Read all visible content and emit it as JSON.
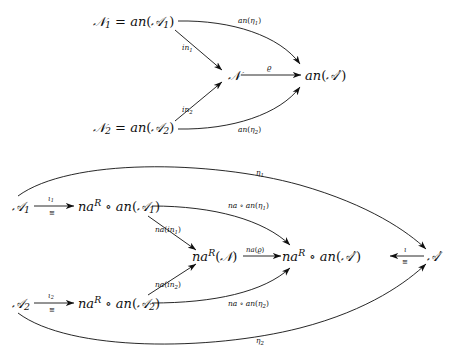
{
  "figure": {
    "type": "commutative-diagram",
    "count": 2
  },
  "diagram_top": {
    "nodes": {
      "n1": {
        "id": "N1",
        "text": "ℕ₁ = an(𝒜₁)",
        "base": "𝒩",
        "sub": "1",
        "rhs": "an(𝒜",
        "rhs_sub": "1",
        "x": 140,
        "y": 22
      },
      "n2": {
        "id": "N2",
        "text": "𝒩₂ = an(𝒜₂)",
        "x": 140,
        "y": 128
      },
      "n": {
        "id": "N",
        "text": "𝒩",
        "x": 238,
        "y": 75
      },
      "target": {
        "id": "anA",
        "text": "an(𝒜′)",
        "x": 333,
        "y": 75
      }
    },
    "edges": [
      {
        "name": "in1",
        "label": "in",
        "label_sub": "1",
        "from": "N1",
        "to": "N"
      },
      {
        "name": "in2",
        "label": "in",
        "label_sub": "2",
        "from": "N2",
        "to": "N"
      },
      {
        "name": "an-eta1",
        "label": "an(η",
        "label_sub": "1",
        "label_tail": ")",
        "from": "N1",
        "to": "anA"
      },
      {
        "name": "an-eta2",
        "label": "an(η",
        "label_sub": "2",
        "label_tail": ")",
        "from": "N2",
        "to": "anA"
      },
      {
        "name": "rho",
        "label": "ϱ",
        "from": "N",
        "to": "anA"
      }
    ]
  },
  "diagram_bottom": {
    "nodes": {
      "a1": {
        "id": "A1",
        "text": "𝒜₁",
        "x": 22,
        "y": 206
      },
      "a2": {
        "id": "A2",
        "text": "𝒜₂",
        "x": 22,
        "y": 303
      },
      "naA1": {
        "id": "naRanA1",
        "text": "naᴿ ∘ an(𝒜₁)",
        "x": 112,
        "y": 206
      },
      "naA2": {
        "id": "naRanA2",
        "text": "naᴿ ∘ an(𝒜₂)",
        "x": 112,
        "y": 303
      },
      "naN": {
        "id": "naRN",
        "text": "naᴿ(𝒩)",
        "x": 223,
        "y": 257
      },
      "naAp": {
        "id": "naRanAp",
        "text": "naᴿ ∘ an(𝒜′)",
        "x": 330,
        "y": 257
      },
      "ap": {
        "id": "Ap",
        "text": "𝒜′",
        "x": 435,
        "y": 257
      }
    },
    "edges": [
      {
        "name": "iota1",
        "label": "ι",
        "label_sub": "1",
        "label_below": "≅",
        "from": "A1",
        "to": "naRanA1"
      },
      {
        "name": "iota2",
        "label": "ι",
        "label_sub": "2",
        "label_below": "≅",
        "from": "A2",
        "to": "naRanA2"
      },
      {
        "name": "na-in1",
        "label": "na(in",
        "label_sub": "1",
        "label_tail": ")",
        "from": "naRanA1",
        "to": "naRN"
      },
      {
        "name": "na-in2",
        "label": "na(in",
        "label_sub": "2",
        "label_tail": ")",
        "from": "naRanA2",
        "to": "naRN"
      },
      {
        "name": "na-rho",
        "label": "na(ϱ)",
        "from": "naRN",
        "to": "naRanAp"
      },
      {
        "name": "na-an-eta1",
        "label": "na ∘ an(η",
        "label_sub": "1",
        "label_tail": ")",
        "from": "naRanA1",
        "to": "naRanAp"
      },
      {
        "name": "na-an-eta2",
        "label": "na ∘ an(η",
        "label_sub": "2",
        "label_tail": ")",
        "from": "naRanA2",
        "to": "naRanAp"
      },
      {
        "name": "iota",
        "label": "ι",
        "label_below": "≅",
        "from": "Ap",
        "to": "naRanAp"
      },
      {
        "name": "eta1",
        "label": "η",
        "label_sub": "1",
        "from": "A1",
        "to": "Ap"
      },
      {
        "name": "eta2",
        "label": "η",
        "label_sub": "2",
        "from": "A2",
        "to": "Ap"
      }
    ]
  },
  "symbols": {
    "script_N": "𝒩",
    "script_A": "𝒜",
    "prime": "′",
    "compose": "∘",
    "iso": "≅",
    "eta": "η",
    "iota": "ι",
    "varrho": "ϱ",
    "an": "an",
    "na": "na",
    "naR": "na",
    "superscript_R": "R",
    "in": "in"
  },
  "colors": {
    "ink": "#101010",
    "background": "#ffffff"
  }
}
